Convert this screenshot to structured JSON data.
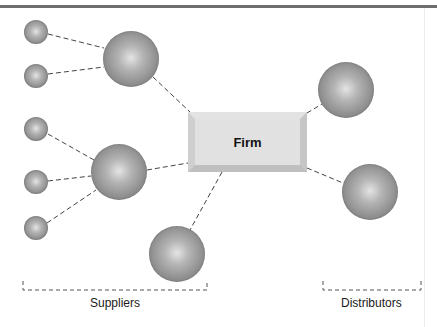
{
  "diagram": {
    "center_node": {
      "label": "Firm"
    },
    "groups": [
      {
        "id": "suppliers",
        "label": "Suppliers"
      },
      {
        "id": "distributors",
        "label": "Distributors"
      }
    ],
    "nodes": {
      "small_suppliers": [
        {
          "cx": 36,
          "cy": 32,
          "r": 12
        },
        {
          "cx": 36,
          "cy": 76,
          "r": 12
        },
        {
          "cx": 36,
          "cy": 129,
          "r": 12
        },
        {
          "cx": 36,
          "cy": 182,
          "r": 12
        },
        {
          "cx": 36,
          "cy": 228,
          "r": 12
        }
      ],
      "large_suppliers": [
        {
          "cx": 131,
          "cy": 59,
          "r": 28
        },
        {
          "cx": 119,
          "cy": 172,
          "r": 28
        },
        {
          "cx": 177,
          "cy": 254,
          "r": 28
        }
      ],
      "distributors": [
        {
          "cx": 346,
          "cy": 90,
          "r": 28
        },
        {
          "cx": 370,
          "cy": 192,
          "r": 28
        }
      ]
    },
    "colors": {
      "sphere_dark": "#6f6f6f",
      "sphere_light": "#e4e4e4",
      "firm_box": "#dcdcdc",
      "rule": "#6e6e6e"
    }
  }
}
